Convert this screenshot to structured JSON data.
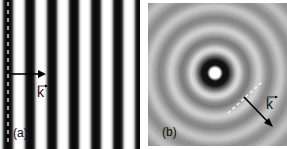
{
  "figure": {
    "panel_a": {
      "label": "(a)",
      "description": "plane wave fronts",
      "wave_vector_label": "k",
      "stripe_period_px": 22,
      "stripe_offset_px": 4,
      "stripe_dark_width_px": 8,
      "colors": {
        "dark": "#0a0a0a",
        "light": "#ffffff"
      }
    },
    "panel_b": {
      "label": "(b)",
      "description": "spherical wave fronts",
      "wave_vector_label": "k",
      "center": {
        "x": 67,
        "y": 70
      },
      "ring_period_px": 22,
      "colors": {
        "background": "#9a9a9a",
        "dark": "#111111",
        "light": "#e6e6e6",
        "center": "#ffffff"
      }
    }
  }
}
